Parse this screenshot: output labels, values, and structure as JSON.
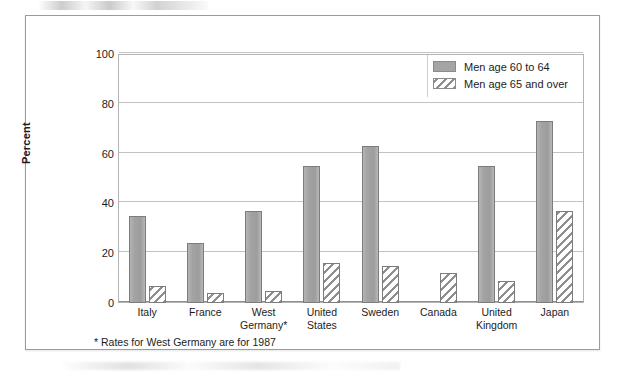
{
  "figure": {
    "y_axis_title": "Percent",
    "footnote": "*  Rates for West Germany are for 1987"
  },
  "legend": {
    "items": [
      {
        "label": "Men age 60 to 64",
        "swatch": "solid-gray-swatch",
        "color": "#a5a5a5"
      },
      {
        "label": "Men age 65 and over",
        "swatch": "diagonal-hatch-swatch",
        "color": "#8e8e8e"
      }
    ]
  },
  "chart_data": {
    "type": "bar",
    "title": "",
    "subtitle": "",
    "xlabel": "",
    "ylabel": "Percent",
    "ylim": [
      0,
      100
    ],
    "yticks": [
      0,
      20,
      40,
      60,
      80,
      100
    ],
    "ytick_labels": [
      "0",
      "20",
      "40",
      "60",
      "80",
      "100"
    ],
    "grid": true,
    "legend_position": "top-right",
    "categories": [
      "Italy",
      "France",
      "West Germany*",
      "United States",
      "Sweden",
      "Canada",
      "United Kingdom",
      "Japan"
    ],
    "category_lines": [
      [
        "Italy"
      ],
      [
        "France"
      ],
      [
        "West",
        "Germany*"
      ],
      [
        "United",
        "States"
      ],
      [
        "Sweden"
      ],
      [
        "Canada"
      ],
      [
        "United",
        "Kingdom"
      ],
      [
        "Japan"
      ]
    ],
    "series": [
      {
        "name": "Men age 60 to 64",
        "values": [
          35,
          24,
          37,
          55,
          63,
          null,
          55,
          73
        ]
      },
      {
        "name": "Men age 65 and over",
        "values": [
          7,
          4,
          5,
          16,
          15,
          12,
          9,
          37
        ]
      }
    ]
  }
}
